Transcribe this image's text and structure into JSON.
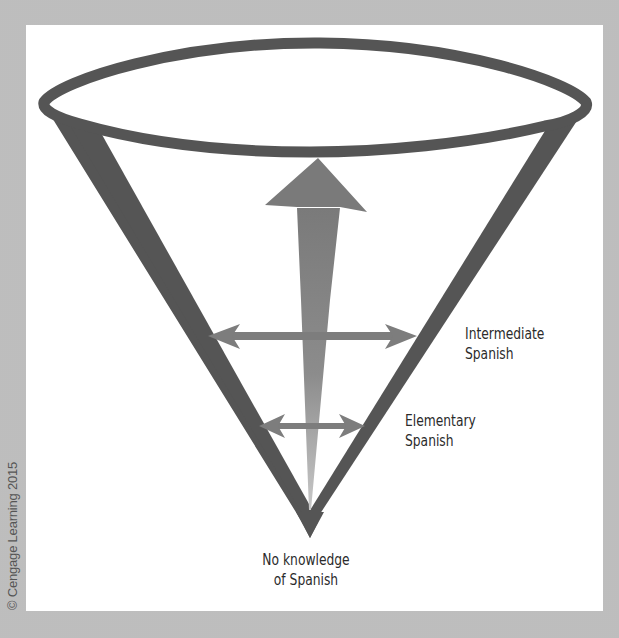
{
  "figure": {
    "type": "cone-diagram",
    "colors": {
      "background": "#bdbdbd",
      "panel": "#ffffff",
      "cone_stroke": "#555555",
      "arrow": "#7a7a7a",
      "text": "#2b2b2b"
    }
  },
  "labels": {
    "intermediate": {
      "line1": "Intermediate",
      "line2": "Spanish"
    },
    "elementary": {
      "line1": "Elementary",
      "line2": "Spanish"
    },
    "base": {
      "line1": "No knowledge",
      "line2": "of Spanish"
    }
  },
  "copyright": "© Cengage Learning 2015"
}
